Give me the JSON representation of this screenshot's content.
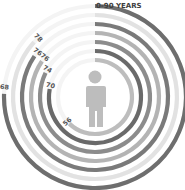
{
  "chart_data": {
    "type": "radial-bar",
    "title": "0-90 YEARS",
    "scale_max": 90,
    "start_angle_deg": 0,
    "direction": "clockwise",
    "series": [
      {
        "label": "68",
        "value": 68,
        "color": "#6e6e6e"
      },
      {
        "label": "78",
        "value": 78,
        "color": "#e2e2e2"
      },
      {
        "label": "76",
        "value": 76,
        "color": "#7a7a7a"
      },
      {
        "label": "76",
        "value": 76,
        "color": "#b4b4b4"
      },
      {
        "label": "74",
        "value": 74,
        "color": "#8c8c8c"
      },
      {
        "label": "70",
        "value": 70,
        "color": "#6a6a6a"
      },
      {
        "label": "56",
        "value": 56,
        "color": "#bdbdbd"
      }
    ],
    "center_icon": "person-icon",
    "background_track_color": "#f4f4f4"
  }
}
